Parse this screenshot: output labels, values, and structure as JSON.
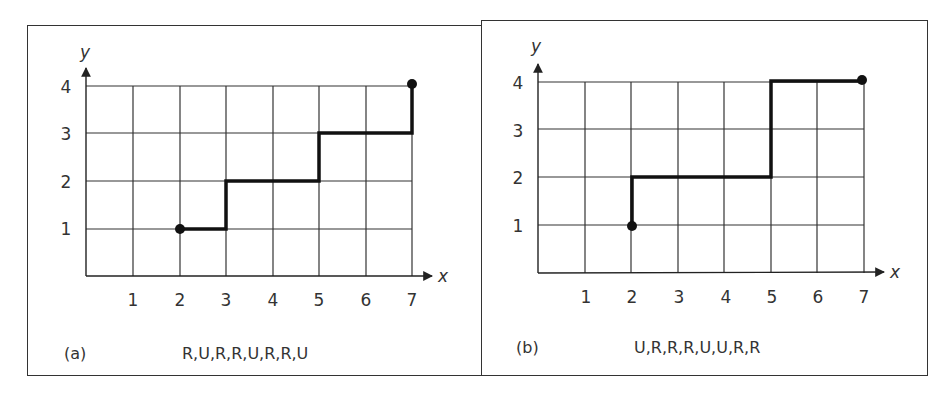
{
  "figure": {
    "panels": [
      {
        "id": "a",
        "label": "(a)",
        "path_code": "R,U,R,R,U,R,R,U",
        "axes": {
          "x_label": "x",
          "y_label": "y",
          "x_ticks": [
            "1",
            "2",
            "3",
            "4",
            "5",
            "6",
            "7"
          ],
          "y_ticks": [
            "1",
            "2",
            "3",
            "4"
          ]
        },
        "path_points": [
          [
            2,
            1
          ],
          [
            3,
            1
          ],
          [
            3,
            2
          ],
          [
            5,
            2
          ],
          [
            5,
            3
          ],
          [
            7,
            3
          ],
          [
            7,
            4
          ]
        ],
        "start": [
          2,
          1
        ],
        "end": [
          7,
          4
        ]
      },
      {
        "id": "b",
        "label": "(b)",
        "path_code": "U,R,R,R,U,U,R,R",
        "axes": {
          "x_label": "x",
          "y_label": "y",
          "x_ticks": [
            "1",
            "2",
            "3",
            "4",
            "5",
            "6",
            "7"
          ],
          "y_ticks": [
            "1",
            "2",
            "3",
            "4"
          ]
        },
        "path_points": [
          [
            2,
            1
          ],
          [
            2,
            2
          ],
          [
            5,
            2
          ],
          [
            5,
            4
          ],
          [
            7,
            4
          ]
        ],
        "start": [
          2,
          1
        ],
        "end": [
          7,
          4
        ]
      }
    ]
  },
  "colors": {
    "grid": "#333333",
    "path": "#111111",
    "border": "#333333",
    "text": "#333333"
  }
}
